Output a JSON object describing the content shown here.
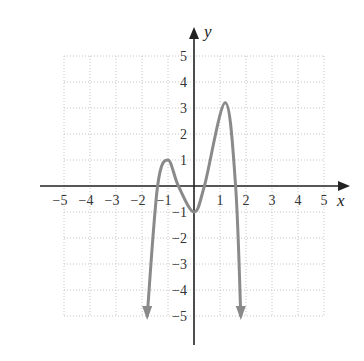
{
  "chart_data": {
    "type": "line",
    "title": "",
    "xlabel": "x",
    "ylabel": "y",
    "xlim": [
      -5,
      5
    ],
    "ylim": [
      -5,
      5
    ],
    "grid": true,
    "grid_style": "dotted",
    "x_ticks": [
      "-5",
      "-4",
      "-3",
      "-2",
      "-1",
      "1",
      "2",
      "3",
      "4",
      "5"
    ],
    "y_ticks": [
      "5",
      "4",
      "3",
      "2",
      "1",
      "-1",
      "-2",
      "-3",
      "-4",
      "-5"
    ],
    "curve_color": "#8a8a8a",
    "series": [
      {
        "name": "f(x)",
        "description": "polynomial curve with arrows at both ends pointing down",
        "key_points": [
          {
            "x": -1.8,
            "y": -5,
            "note": "arrow end (down)"
          },
          {
            "x": -1.4,
            "y": 0,
            "note": "x-intercept"
          },
          {
            "x": -1,
            "y": 1,
            "note": "local max"
          },
          {
            "x": -0.6,
            "y": 0,
            "note": "x-intercept"
          },
          {
            "x": 0,
            "y": -1,
            "note": "local min"
          },
          {
            "x": 0.4,
            "y": 0,
            "note": "x-intercept"
          },
          {
            "x": 1.2,
            "y": 3.2,
            "note": "local max"
          },
          {
            "x": 1.6,
            "y": 0,
            "note": "x-intercept"
          },
          {
            "x": 1.8,
            "y": -5,
            "note": "arrow end (down)"
          }
        ]
      }
    ]
  }
}
